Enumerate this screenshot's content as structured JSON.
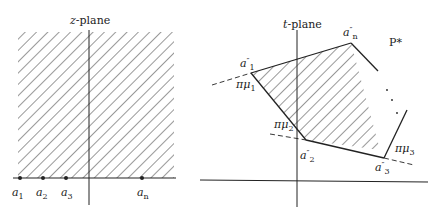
{
  "left_panel": {
    "title_var": "z",
    "title_rest": "-plane",
    "points": [
      {
        "name": "a",
        "sub": "1"
      },
      {
        "name": "a",
        "sub": "2"
      },
      {
        "name": "a",
        "sub": "3"
      },
      {
        "name": "a",
        "sub": "n"
      }
    ]
  },
  "right_panel": {
    "title_var": "t",
    "title_rest": "-plane",
    "polygon_label": "P*",
    "vertices": [
      {
        "name": "a",
        "prime": "″",
        "sub": "1"
      },
      {
        "name": "a",
        "prime": "″",
        "sub": "2"
      },
      {
        "name": "a",
        "prime": "″",
        "sub": "3"
      },
      {
        "name": "a",
        "prime": "″",
        "sub": "n"
      }
    ],
    "angles": [
      {
        "name": "πμ",
        "sub": "1"
      },
      {
        "name": "πμ",
        "sub": "2"
      },
      {
        "name": "πμ",
        "sub": "3"
      }
    ]
  },
  "colors": {
    "ink": "#222222",
    "background": "#ffffff"
  }
}
